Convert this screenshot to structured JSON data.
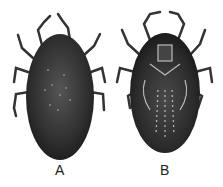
{
  "figure": {
    "panels": [
      {
        "label": "A",
        "view": "dorsal"
      },
      {
        "label": "B",
        "view": "ventral"
      }
    ],
    "colors": {
      "body": "#2b2b2b",
      "legs": "#3a3a3a",
      "background": "#ffffff"
    }
  }
}
